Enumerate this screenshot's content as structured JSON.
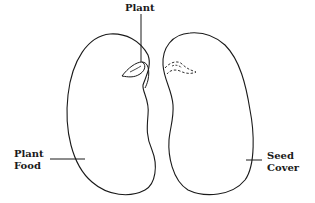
{
  "diagram": {
    "labels": {
      "plant": "Plant",
      "plant_food_line1": "Plant",
      "plant_food_line2": "Food",
      "seed_cover_line1": "Seed",
      "seed_cover_line2": "Cover"
    },
    "colors": {
      "line": "#1a1a1a",
      "background": "#ffffff"
    }
  }
}
